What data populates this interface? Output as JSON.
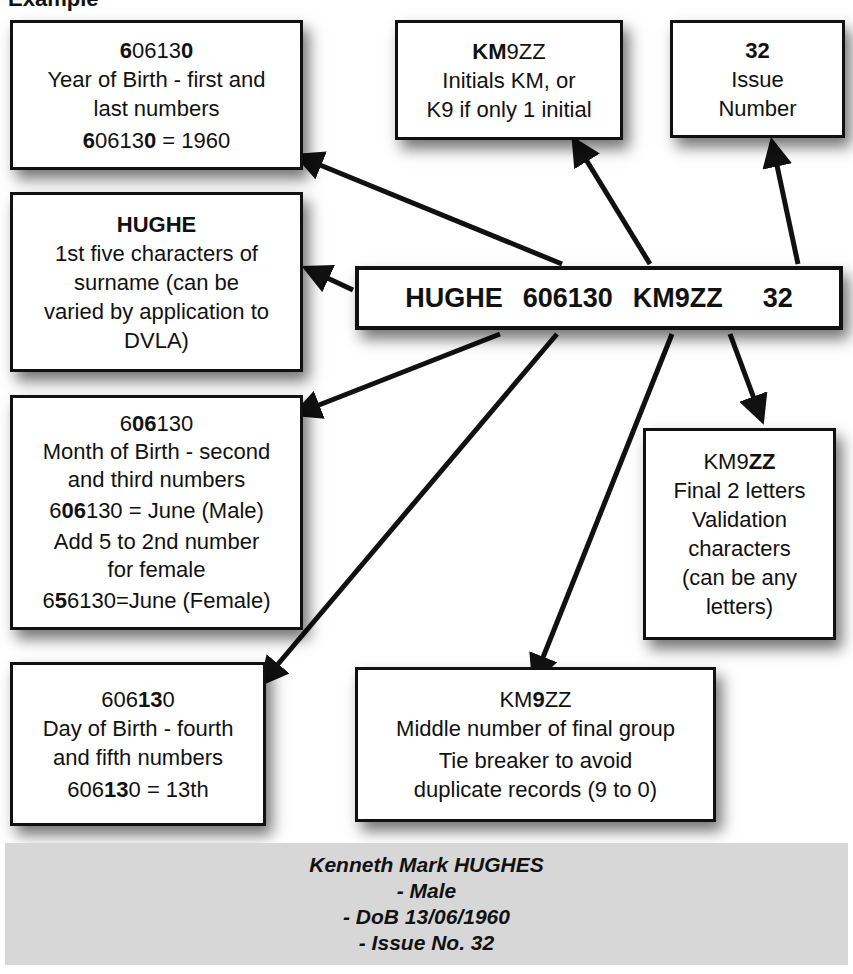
{
  "title": "Example",
  "licence_number": {
    "surname": "HUGHE",
    "dob": "606130",
    "initials_group": "KM9ZZ",
    "issue": "32"
  },
  "boxes": {
    "year": {
      "code_parts": [
        {
          "text": "6",
          "bold": true
        },
        {
          "text": "0613",
          "bold": false
        },
        {
          "text": "0",
          "bold": true
        }
      ],
      "lines": [
        "Year of Birth - first and",
        "last numbers"
      ],
      "example_parts": [
        {
          "text": "6",
          "bold": true
        },
        {
          "text": "0613",
          "bold": false
        },
        {
          "text": "0",
          "bold": true
        },
        {
          "text": " = 1960",
          "bold": false
        }
      ]
    },
    "initials": {
      "code_parts": [
        {
          "text": "KM",
          "bold": true
        },
        {
          "text": "9ZZ",
          "bold": false
        }
      ],
      "lines": [
        "Initials KM, or",
        "K9 if only 1 initial"
      ]
    },
    "issue": {
      "code": "32",
      "lines": [
        "Issue",
        "Number"
      ]
    },
    "surname": {
      "code": "HUGHE",
      "lines": [
        "1st five characters of",
        "surname (can be",
        "varied by application to",
        "DVLA)"
      ]
    },
    "month": {
      "code_parts": [
        {
          "text": "6",
          "bold": false
        },
        {
          "text": "06",
          "bold": true
        },
        {
          "text": "130",
          "bold": false
        }
      ],
      "lines": [
        "Month of Birth - second",
        "and third numbers"
      ],
      "example_parts": [
        {
          "text": "6",
          "bold": false
        },
        {
          "text": "06",
          "bold": true
        },
        {
          "text": "130 = June (Male)",
          "bold": false
        }
      ],
      "lines2": [
        "Add 5 to 2nd number",
        "for female"
      ],
      "example2_parts": [
        {
          "text": "6",
          "bold": false
        },
        {
          "text": "5",
          "bold": true
        },
        {
          "text": "6130=June (Female)",
          "bold": false
        }
      ]
    },
    "validation": {
      "code_parts": [
        {
          "text": "KM9",
          "bold": false
        },
        {
          "text": "ZZ",
          "bold": true
        }
      ],
      "lines": [
        "Final 2 letters",
        "Validation",
        "characters",
        "(can be any",
        "letters)"
      ]
    },
    "day": {
      "code_parts": [
        {
          "text": "606",
          "bold": false
        },
        {
          "text": "13",
          "bold": true
        },
        {
          "text": "0",
          "bold": false
        }
      ],
      "lines": [
        "Day of Birth - fourth",
        "and fifth numbers"
      ],
      "example_parts": [
        {
          "text": "606",
          "bold": false
        },
        {
          "text": "13",
          "bold": true
        },
        {
          "text": "0 = 13th",
          "bold": false
        }
      ]
    },
    "tiebreaker": {
      "code_parts": [
        {
          "text": "KM",
          "bold": false
        },
        {
          "text": "9",
          "bold": true
        },
        {
          "text": "ZZ",
          "bold": false
        }
      ],
      "lines": [
        "Middle number of final group",
        "Tie breaker to avoid",
        "duplicate records (9 to 0)"
      ]
    }
  },
  "footer": {
    "lines": [
      "Kenneth Mark HUGHES",
      "- Male",
      "- DoB 13/06/1960",
      "- Issue No. 32"
    ]
  },
  "colors": {
    "stroke": "#111111",
    "footer_bg": "#d7d7d7",
    "box_bg": "#ffffff"
  }
}
